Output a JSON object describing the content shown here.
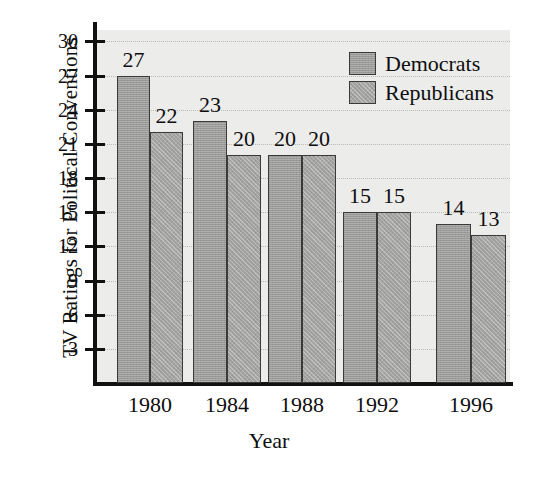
{
  "chart_data": {
    "type": "bar",
    "title": "",
    "xlabel": "Year",
    "ylabel": "TV Ratings for Political Conventions",
    "categories": [
      "1980",
      "1984",
      "1988",
      "1992",
      "1996"
    ],
    "series": [
      {
        "name": "Democrats",
        "values": [
          27,
          23,
          20,
          15,
          14
        ],
        "color": "#9a9a99"
      },
      {
        "name": "Republicans",
        "values": [
          22,
          20,
          20,
          15,
          13
        ],
        "color": "#a3a3a1"
      }
    ],
    "ylim": [
      0,
      31
    ],
    "yticks": [
      3,
      6,
      9,
      12,
      15,
      18,
      21,
      24,
      27,
      30
    ],
    "ytick_labels": [
      "3",
      "6",
      "9",
      "12",
      "15",
      "18",
      "21",
      "24",
      "27",
      "30"
    ],
    "grid": true,
    "grid_axis": "y",
    "legend_position": "top-right",
    "bar_value_labels": [
      [
        "27",
        "22"
      ],
      [
        "23",
        "20"
      ],
      [
        "20",
        "20"
      ],
      [
        "15",
        "15"
      ],
      [
        "14",
        "13"
      ]
    ],
    "plot_background": "#ececeb",
    "axis_color": "#111111"
  },
  "legend": {
    "entries": [
      {
        "label": "Democrats"
      },
      {
        "label": "Republicans"
      }
    ]
  },
  "axes": {
    "y_title": "TV Ratings for Political Conventions",
    "x_title": "Year"
  }
}
